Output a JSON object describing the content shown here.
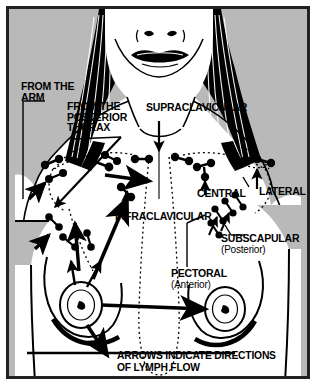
{
  "figure": {
    "border_color": "#222222",
    "background_gray": "#b9b9b9",
    "skin_color": "#ffffff",
    "ink_color": "#000000"
  },
  "labels": {
    "from_the_arm": "FROM THE\nARM",
    "from_the_posterior_thorax": "FROM THE\nPOSTERIOR\nTHORAX",
    "supraclavicular": "SUPRACLAVICULAR",
    "infraclavicular": "INFRACLAVICULAR",
    "central": "CENTRAL",
    "lateral": "LATERAL",
    "subscapular": "SUBSCAPULAR",
    "subscapular_qualifier": "(Posterior)",
    "pectoral": "PECTORAL",
    "pectoral_qualifier": "(Anterior)",
    "caption": "ARROWS INDICATE DIRECTIONS\nOF LYMPH FLOW"
  },
  "icon_names": {
    "lymph_node": "lymph-node-icon",
    "flow_arrow": "flow-arrow-icon",
    "leader_line": "leader-line",
    "lymph_vessel": "lymph-vessel-dotted-line"
  }
}
